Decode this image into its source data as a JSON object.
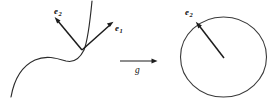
{
  "figure": {
    "type": "mathematical-diagram",
    "background_color": "#ffffff",
    "ink_color": "#1c1c1c",
    "left_panel": {
      "name": "curve-with-frame",
      "curve_label": "",
      "vectors": [
        {
          "id": "e2",
          "label": "e",
          "subscript": "2",
          "text": "e2"
        },
        {
          "id": "e1",
          "label": "e",
          "subscript": "1",
          "text": "e1"
        }
      ]
    },
    "map_arrow": {
      "name": "map-arrow",
      "label": "g"
    },
    "right_panel": {
      "name": "circle-with-vector",
      "shape": "circle",
      "vectors": [
        {
          "id": "e2",
          "label": "e",
          "subscript": "2",
          "text": "e2"
        }
      ]
    }
  },
  "labels": {
    "e_base": "e",
    "sub_one": "1",
    "sub_two": "2",
    "g": "g"
  }
}
